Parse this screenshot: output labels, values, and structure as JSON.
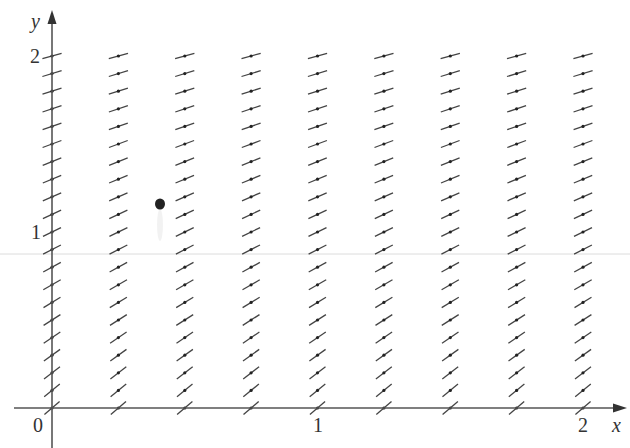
{
  "diagram": {
    "type": "slope_field",
    "x_axis": {
      "label": "x",
      "ticks": [
        "0",
        "1",
        "2"
      ],
      "range": [
        0,
        2
      ]
    },
    "y_axis": {
      "label": "y",
      "ticks": [
        "1",
        "2"
      ],
      "range": [
        0,
        2
      ]
    },
    "grid": {
      "x_values": [
        0,
        0.25,
        0.5,
        0.75,
        1,
        1.25,
        1.5,
        1.75,
        2
      ],
      "y_values": [
        0,
        0.1,
        0.2,
        0.3,
        0.4,
        0.5,
        0.6,
        0.7,
        0.8,
        0.9,
        1.0,
        1.1,
        1.2,
        1.3,
        1.4,
        1.5,
        1.6,
        1.7,
        1.8,
        1.9,
        2.0
      ]
    },
    "slope_description": "Slopes are positive, independent of x, and decrease as y increases (steepest near y=0, flattest near y=2)",
    "colors": {
      "axis": "#555555",
      "segment": "#444444",
      "label": "#333333",
      "faint_line": "#d8d8d8"
    }
  },
  "labels": {
    "origin": "0",
    "x_tick_1": "1",
    "x_tick_2": "2",
    "y_tick_1": "1",
    "y_tick_2": "2",
    "x_axis_name": "x",
    "y_axis_name": "y"
  }
}
